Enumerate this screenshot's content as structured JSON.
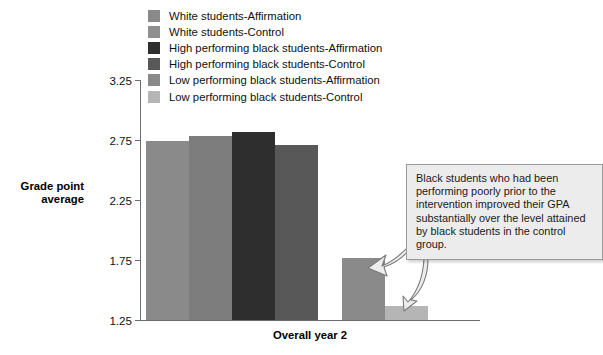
{
  "chart_data": {
    "type": "bar",
    "title": "",
    "xlabel": "Overall year 2",
    "ylabel": "Grade point average",
    "categories": [
      "Overall year 2"
    ],
    "ylim": [
      1.25,
      3.25
    ],
    "ytick_labels": [
      "1.25",
      "1.75",
      "2.25",
      "2.75",
      "3.25"
    ],
    "ytick_values": [
      1.25,
      1.75,
      2.25,
      2.75,
      3.25
    ],
    "grid": false,
    "legend_position": "top",
    "bars": [
      {
        "label": "White students-Affirmation",
        "value": 2.74,
        "color": "#8a8a8a"
      },
      {
        "label": "White students-Control",
        "value": 2.78,
        "color": "#7d7d7d"
      },
      {
        "label": "High performing black students-Affirmation",
        "value": 2.82,
        "color": "#2e2e2e"
      },
      {
        "label": "High performing black students-Control",
        "value": 2.71,
        "color": "#585858"
      },
      {
        "label": "Low performing black students-Affirmation",
        "value": 1.77,
        "color": "#8a8a8a"
      },
      {
        "label": "Low performing black students-Control",
        "value": 1.37,
        "color": "#b5b5b5"
      }
    ]
  },
  "legend": {
    "items": [
      {
        "label": "White students-Affirmation",
        "color": "#8a8a8a"
      },
      {
        "label": "White students-Control",
        "color": "#8f8f8f"
      },
      {
        "label": "High performing black students-Affirmation",
        "color": "#2e2e2e"
      },
      {
        "label": "High performing black students-Control",
        "color": "#585858"
      },
      {
        "label": "Low performing black students-Affirmation",
        "color": "#8a8a8a"
      },
      {
        "label": "Low performing black students-Control",
        "color": "#b5b5b5"
      }
    ]
  },
  "axes": {
    "y_title": "Grade point average",
    "y_title_line1": "Grade point",
    "y_title_line2": "average",
    "x_title": "Overall year 2",
    "ticks": [
      "3.25",
      "2.75",
      "2.25",
      "1.75",
      "1.25"
    ]
  },
  "callout": {
    "text": "Black students who had been performing poorly prior to the intervention improved their GPA substantially over the level attained by black students in the control group."
  },
  "colors": {
    "axis": "#6e6e6e",
    "callout_bg": "#ececed",
    "callout_border": "#9a9a9a",
    "text": "#111111"
  }
}
